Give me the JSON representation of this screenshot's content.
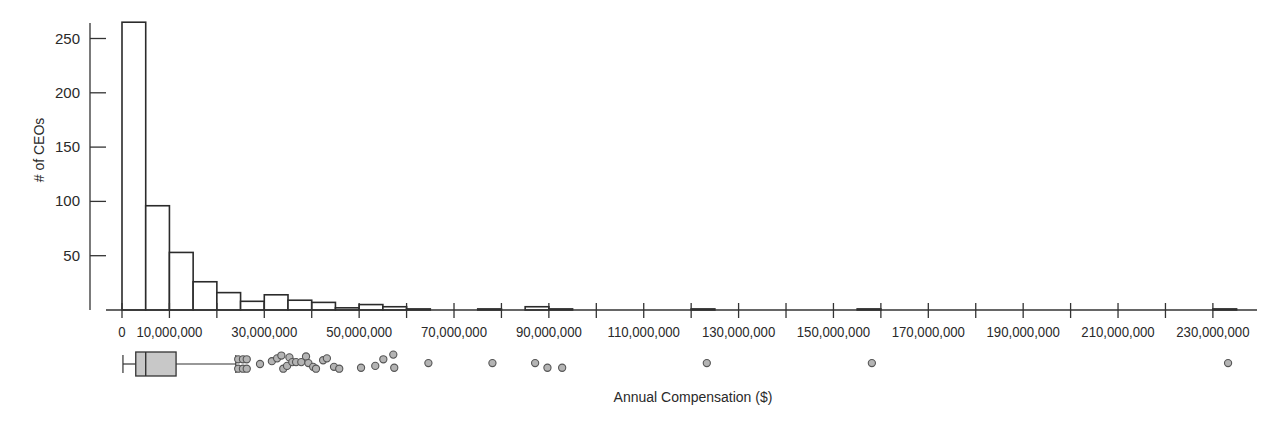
{
  "chart_data": {
    "type": "bar",
    "subtype": "histogram_with_boxplot",
    "title": "",
    "xlabel": "Annual Compensation ($)",
    "ylabel": "# of CEOs",
    "bin_width": 5000000,
    "xlim": [
      0,
      235000000
    ],
    "ylim": [
      0,
      265
    ],
    "grid": false,
    "legend": null,
    "y_ticks": [
      50,
      100,
      150,
      200,
      250
    ],
    "x_ticks": [
      0,
      10000000,
      20000000,
      30000000,
      40000000,
      50000000,
      60000000,
      70000000,
      80000000,
      90000000,
      100000000,
      110000000,
      120000000,
      130000000,
      140000000,
      150000000,
      160000000,
      170000000,
      180000000,
      190000000,
      200000000,
      210000000,
      220000000,
      230000000
    ],
    "x_tick_labels": [
      {
        "value": 0,
        "label": "0"
      },
      {
        "value": 10000000,
        "label": "10,000,000"
      },
      {
        "value": 30000000,
        "label": "30,000,000"
      },
      {
        "value": 50000000,
        "label": "50,000,000"
      },
      {
        "value": 70000000,
        "label": "70,000,000"
      },
      {
        "value": 90000000,
        "label": "90,000,000"
      },
      {
        "value": 110000000,
        "label": "110,000,000"
      },
      {
        "value": 130000000,
        "label": "130,000,000"
      },
      {
        "value": 150000000,
        "label": "150,000,000"
      },
      {
        "value": 170000000,
        "label": "170,000,000"
      },
      {
        "value": 190000000,
        "label": "190,000,000"
      },
      {
        "value": 210000000,
        "label": "210,000,000"
      },
      {
        "value": 230000000,
        "label": "230,000,000"
      }
    ],
    "bins": [
      {
        "start": 0,
        "end": 5000000,
        "count": 265
      },
      {
        "start": 5000000,
        "end": 10000000,
        "count": 96
      },
      {
        "start": 10000000,
        "end": 15000000,
        "count": 53
      },
      {
        "start": 15000000,
        "end": 20000000,
        "count": 26
      },
      {
        "start": 20000000,
        "end": 25000000,
        "count": 16
      },
      {
        "start": 25000000,
        "end": 30000000,
        "count": 8
      },
      {
        "start": 30000000,
        "end": 35000000,
        "count": 14
      },
      {
        "start": 35000000,
        "end": 40000000,
        "count": 9
      },
      {
        "start": 40000000,
        "end": 45000000,
        "count": 7
      },
      {
        "start": 45000000,
        "end": 50000000,
        "count": 2
      },
      {
        "start": 50000000,
        "end": 55000000,
        "count": 5
      },
      {
        "start": 55000000,
        "end": 60000000,
        "count": 3
      },
      {
        "start": 60000000,
        "end": 65000000,
        "count": 1
      },
      {
        "start": 75000000,
        "end": 80000000,
        "count": 1
      },
      {
        "start": 85000000,
        "end": 90000000,
        "count": 3
      },
      {
        "start": 90000000,
        "end": 95000000,
        "count": 1
      },
      {
        "start": 120000000,
        "end": 125000000,
        "count": 1
      },
      {
        "start": 155000000,
        "end": 160000000,
        "count": 1
      },
      {
        "start": 230000000,
        "end": 235000000,
        "count": 1
      }
    ],
    "boxplot": {
      "whisker_low": 200000,
      "q1": 2900000,
      "median": 5000000,
      "q3": 11400000,
      "whisker_high": 24000000,
      "outliers": [
        {
          "x": 24500000,
          "row": -1
        },
        {
          "x": 25500000,
          "row": -1
        },
        {
          "x": 26300000,
          "row": -1
        },
        {
          "x": 24500000,
          "row": 1
        },
        {
          "x": 25500000,
          "row": 1
        },
        {
          "x": 26300000,
          "row": 1
        },
        {
          "x": 29100000,
          "row": 0
        },
        {
          "x": 31600000,
          "row": -0.6
        },
        {
          "x": 32700000,
          "row": -1.2
        },
        {
          "x": 33600000,
          "row": -1.8
        },
        {
          "x": 34000000,
          "row": 1
        },
        {
          "x": 34800000,
          "row": 0.4
        },
        {
          "x": 35300000,
          "row": -1.4
        },
        {
          "x": 35900000,
          "row": -0.4
        },
        {
          "x": 36700000,
          "row": -0.4
        },
        {
          "x": 37800000,
          "row": -0.4
        },
        {
          "x": 38800000,
          "row": -1.6
        },
        {
          "x": 39300000,
          "row": -0.2
        },
        {
          "x": 40300000,
          "row": 0.6
        },
        {
          "x": 40900000,
          "row": 1
        },
        {
          "x": 42400000,
          "row": -0.8
        },
        {
          "x": 43200000,
          "row": -1.2
        },
        {
          "x": 44700000,
          "row": 0.6
        },
        {
          "x": 45800000,
          "row": 1
        },
        {
          "x": 50400000,
          "row": 0.8
        },
        {
          "x": 53400000,
          "row": 0.4
        },
        {
          "x": 55100000,
          "row": -1
        },
        {
          "x": 57200000,
          "row": -2
        },
        {
          "x": 57400000,
          "row": 0.8
        },
        {
          "x": 64600000,
          "row": -0.2
        },
        {
          "x": 78100000,
          "row": -0.2
        },
        {
          "x": 87100000,
          "row": -0.2
        },
        {
          "x": 89700000,
          "row": 0.8
        },
        {
          "x": 92800000,
          "row": 0.8
        },
        {
          "x": 123300000,
          "row": -0.2
        },
        {
          "x": 158100000,
          "row": -0.2
        },
        {
          "x": 233200000,
          "row": -0.2
        }
      ]
    }
  },
  "style": {
    "bar_fill": "#ffffff",
    "bar_stroke": "#2b2b2b",
    "axis_color": "#333333",
    "box_fill": "#c8c8c8",
    "outlier_fill": "#b4b4b4",
    "outlier_stroke": "#555555",
    "text_color": "#2a2a2a"
  },
  "layout": {
    "x0_px": 122,
    "px_per_10m": 47.43,
    "baseline_y": 310,
    "px_per_count": 1.086,
    "y_axis_x": 90,
    "y_axis_top": 23,
    "x_axis_start": 106,
    "x_axis_end": 1257,
    "box_center_y": 364,
    "box_half_height": 12,
    "outlier_radius": 3.6,
    "outlier_row_px": 4.7
  }
}
